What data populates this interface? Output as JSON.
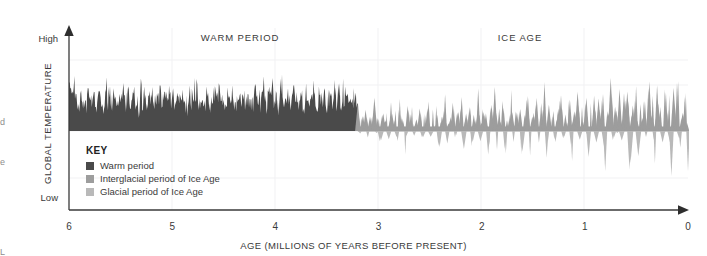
{
  "figure": {
    "periods": [
      {
        "name": "warm-period",
        "label": "WARM PERIOD"
      },
      {
        "name": "ice-age",
        "label": "ICE AGE"
      }
    ]
  },
  "axes": {
    "y": {
      "label": "GLOBAL TEMPERATURE",
      "high_label": "High",
      "low_label": "Low"
    },
    "x": {
      "label": "AGE (MILLIONS OF YEARS BEFORE PRESENT)",
      "ticks": [
        "6",
        "5",
        "4",
        "3",
        "2",
        "1",
        "0"
      ]
    }
  },
  "legend": {
    "title": "KEY",
    "items": [
      {
        "label": "Warm period",
        "color": "#4a4a4a"
      },
      {
        "label": "Interglacial period of Ice Age",
        "color": "#9d9d9d"
      },
      {
        "label": "Glacial period of Ice Age",
        "color": "#b9b9b9"
      }
    ]
  },
  "margin_fragments": [
    "d",
    "e",
    "L"
  ],
  "colors": {
    "warm": "#4a4a4a",
    "interglacial": "#9d9d9d",
    "glacial": "#b9b9b9",
    "axis": "#3a3a3a",
    "grid": "#f0f0f2",
    "text": "#3a3a3a"
  },
  "chart_data": {
    "type": "area",
    "title": "",
    "xlabel": "AGE (MILLIONS OF YEARS BEFORE PRESENT)",
    "ylabel": "GLOBAL TEMPERATURE",
    "xlim": [
      6,
      0
    ],
    "ylim": [
      "Low",
      "High"
    ],
    "x_direction": "reversed",
    "grid": "faint",
    "legend_position": "inside-lower-left",
    "annotations": [
      {
        "text": "WARM PERIOD",
        "x_center": 4.55
      },
      {
        "text": "ICE AGE",
        "x_center": 1.55
      }
    ],
    "regime_boundary_ma": 3.2,
    "baseline_note": "Warm-period series fills from a mid-level baseline upward; Ice-Age series oscillates above (interglacial) and below (glacial) the same baseline.",
    "series": [
      {
        "name": "Warm period",
        "color": "#4a4a4a",
        "x_range_ma": [
          6.0,
          3.2
        ],
        "sampling_ma": 0.02,
        "values": [
          0.62,
          0.46,
          0.38,
          0.55,
          0.41,
          0.33,
          0.5,
          0.36,
          0.44,
          0.31,
          0.58,
          0.4,
          0.34,
          0.47,
          0.3,
          0.52,
          0.38,
          0.43,
          0.29,
          0.49,
          0.35,
          0.56,
          0.32,
          0.45,
          0.39,
          0.28,
          0.51,
          0.37,
          0.6,
          0.33,
          0.42,
          0.48,
          0.3,
          0.54,
          0.36,
          0.4,
          0.27,
          0.57,
          0.34,
          0.46,
          0.31,
          0.5,
          0.38,
          0.63,
          0.29,
          0.44,
          0.35,
          0.52,
          0.32,
          0.41,
          0.47,
          0.28,
          0.55,
          0.37,
          0.43,
          0.3,
          0.59,
          0.33,
          0.48,
          0.36,
          0.4,
          0.26,
          0.53,
          0.39,
          0.45,
          0.31,
          0.61,
          0.34,
          0.42,
          0.49,
          0.29,
          0.56,
          0.35,
          0.38,
          0.27,
          0.51,
          0.44,
          0.32,
          0.58,
          0.36,
          0.4,
          0.3,
          0.47,
          0.33,
          0.54,
          0.37,
          0.43,
          0.28,
          0.6,
          0.34,
          0.46,
          0.31,
          0.5,
          0.39,
          0.35,
          0.26,
          0.57,
          0.41,
          0.45,
          0.32,
          0.52,
          0.36,
          0.29,
          0.48,
          0.38,
          0.55,
          0.33,
          0.42,
          0.3,
          0.59,
          0.35,
          0.44,
          0.27,
          0.51,
          0.37,
          0.4,
          0.62,
          0.31,
          0.46,
          0.34,
          0.49,
          0.28,
          0.53,
          0.39,
          0.43,
          0.32,
          0.58,
          0.36,
          0.3,
          0.47,
          0.41,
          0.26,
          0.54,
          0.35,
          0.45,
          0.38,
          0.33,
          0.56,
          0.29,
          0.5,
          0.37,
          0.42,
          0.31,
          0.6,
          0.34,
          0.48,
          0.27,
          0.52,
          0.4,
          0.36
        ]
      },
      {
        "name": "Ice Age",
        "color_interglacial": "#9d9d9d",
        "color_glacial": "#b9b9b9",
        "x_range_ma": [
          3.2,
          0.0
        ],
        "sampling_ma": 0.02,
        "values": [
          0.55,
          -0.1,
          0.34,
          0.08,
          0.45,
          -0.22,
          0.26,
          0.12,
          0.5,
          -0.05,
          0.3,
          -0.35,
          0.4,
          0.15,
          0.22,
          -0.18,
          0.48,
          0.06,
          0.33,
          -0.28,
          0.58,
          0.1,
          0.25,
          -0.4,
          0.38,
          0.14,
          0.44,
          -0.12,
          0.29,
          0.05,
          0.52,
          -0.3,
          0.35,
          0.18,
          0.41,
          -0.2,
          0.27,
          0.09,
          0.47,
          -0.45,
          0.31,
          0.13,
          0.56,
          -0.15,
          0.24,
          0.07,
          0.43,
          -0.33,
          0.37,
          0.11,
          0.5,
          -0.25,
          0.28,
          0.16,
          0.46,
          -0.38,
          0.32,
          0.04,
          0.54,
          -0.17,
          0.39,
          0.2,
          0.23,
          -0.5,
          0.42,
          0.08,
          0.6,
          -0.27,
          0.34,
          0.12,
          0.48,
          -0.42,
          0.26,
          0.17,
          0.51,
          -0.13,
          0.36,
          0.06,
          0.44,
          -0.55,
          0.3,
          0.19,
          0.57,
          -0.31,
          0.25,
          0.1,
          0.49,
          -0.23,
          0.38,
          0.14,
          0.63,
          -0.47,
          0.29,
          0.05,
          0.41,
          -0.36,
          0.33,
          0.21,
          0.53,
          -0.19,
          0.27,
          0.09,
          0.46,
          -0.58,
          0.35,
          0.15,
          0.59,
          -0.29,
          0.24,
          0.11,
          0.5,
          -0.44,
          0.31,
          0.07,
          0.55,
          -0.21,
          0.37,
          0.18,
          0.43,
          -0.52,
          0.28,
          0.13,
          0.66,
          -0.34,
          0.32,
          0.06,
          0.47,
          -0.26,
          0.39,
          0.22,
          0.61,
          -0.6,
          0.26,
          0.16,
          0.52,
          -0.39,
          0.3,
          0.08,
          0.45,
          -0.23,
          0.7,
          0.12,
          0.34,
          -0.48,
          0.58,
          0.19,
          0.27,
          -0.31,
          0.64,
          0.1,
          0.36,
          -0.56,
          0.42,
          0.14,
          0.68,
          -0.28,
          0.25,
          0.2,
          0.49,
          -0.43
        ]
      }
    ]
  }
}
